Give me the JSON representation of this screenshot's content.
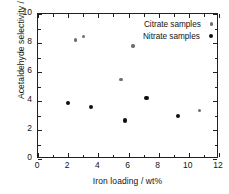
{
  "chart_data": {
    "type": "scatter",
    "title": "",
    "xlabel": "Iron loading / wt%",
    "ylabel": "Acetaldehyde selectivity / %",
    "xlim": [
      0,
      12
    ],
    "ylim": [
      0,
      10
    ],
    "xticks": [
      0,
      2,
      4,
      6,
      8,
      10,
      12
    ],
    "yticks": [
      0,
      2,
      4,
      6,
      8,
      10
    ],
    "xtick_labels": [
      "0",
      "2",
      "4",
      "6",
      "8",
      "10",
      "12"
    ],
    "ytick_labels": [
      "0",
      "2",
      "4",
      "6",
      "8",
      "10"
    ],
    "minor_ticks": true,
    "grid": false,
    "legend_position": "top-right",
    "series": [
      {
        "name": "Citrate samples",
        "marker": "small-gray-circle",
        "color": "#6e6e6e",
        "points": [
          {
            "x": 2.5,
            "y": 8.2
          },
          {
            "x": 3.0,
            "y": 8.45
          },
          {
            "x": 5.5,
            "y": 5.5
          },
          {
            "x": 6.3,
            "y": 7.8
          },
          {
            "x": 10.7,
            "y": 3.35
          }
        ]
      },
      {
        "name": "Nitrate samples",
        "marker": "large-black-circle",
        "color": "#101010",
        "points": [
          {
            "x": 2.0,
            "y": 3.85
          },
          {
            "x": 3.5,
            "y": 3.6
          },
          {
            "x": 5.75,
            "y": 2.65
          },
          {
            "x": 7.2,
            "y": 4.2
          },
          {
            "x": 9.3,
            "y": 2.95
          }
        ]
      }
    ]
  },
  "legend": {
    "entries": [
      {
        "label": "Citrate samples"
      },
      {
        "label": "Nitrate samples"
      }
    ]
  }
}
